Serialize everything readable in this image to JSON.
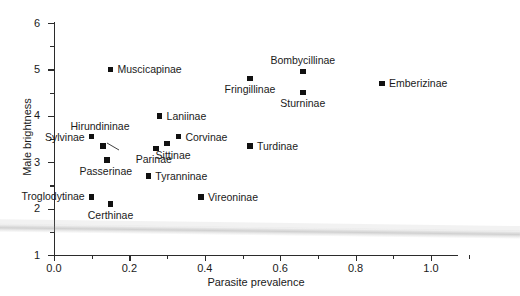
{
  "chart_data": {
    "type": "scatter",
    "title": "",
    "xlabel": "Parasite prevalence",
    "ylabel": "Male brightness",
    "xlim": [
      0.0,
      1.1
    ],
    "ylim": [
      1,
      6
    ],
    "grid": false,
    "legend": "none",
    "marker": "filled-square",
    "marker_color": "#111111",
    "xticks_major": [
      0.0,
      0.2,
      0.4,
      0.6,
      0.8,
      1.0
    ],
    "xticks_major_labels": [
      "0.0",
      "0.2",
      "0.4",
      "0.6",
      "0.8",
      "1.0"
    ],
    "xticks_minor": [
      0.1,
      0.3,
      0.5,
      0.7,
      0.9,
      1.1
    ],
    "yticks_major": [
      1,
      2,
      3,
      4,
      5,
      6
    ],
    "yticks_major_labels": [
      "1",
      "2",
      "3",
      "4",
      "5",
      "6"
    ],
    "yticks_minor": [
      1.5,
      2.5,
      3.5,
      4.5,
      5.5
    ],
    "points": [
      {
        "label": "Muscicapinae",
        "x": 0.15,
        "y": 5.0,
        "label_pos": "right"
      },
      {
        "label": "Bombycillinae",
        "x": 0.66,
        "y": 4.95,
        "label_pos": "above"
      },
      {
        "label": "Fringillinae",
        "x": 0.52,
        "y": 4.8,
        "label_pos": "below"
      },
      {
        "label": "Emberizinae",
        "x": 0.87,
        "y": 4.7,
        "label_pos": "right"
      },
      {
        "label": "Sturninae",
        "x": 0.66,
        "y": 4.5,
        "label_pos": "below"
      },
      {
        "label": "Laniinae",
        "x": 0.28,
        "y": 4.0,
        "label_pos": "right"
      },
      {
        "label": "Sylvinae",
        "x": 0.1,
        "y": 3.55,
        "label_pos": "left"
      },
      {
        "label": "Corvinae",
        "x": 0.33,
        "y": 3.55,
        "label_pos": "right"
      },
      {
        "label": "Hirundininae",
        "x": 0.13,
        "y": 3.35,
        "label_pos": "leader"
      },
      {
        "label": "Sittinae",
        "x": 0.3,
        "y": 3.4,
        "label_pos": "below-right"
      },
      {
        "label": "Turdinae",
        "x": 0.52,
        "y": 3.35,
        "label_pos": "right"
      },
      {
        "label": "Parinae",
        "x": 0.27,
        "y": 3.3,
        "label_pos": "below"
      },
      {
        "label": "Passerinae",
        "x": 0.14,
        "y": 3.05,
        "label_pos": "below"
      },
      {
        "label": "Tyranninae",
        "x": 0.25,
        "y": 2.7,
        "label_pos": "right"
      },
      {
        "label": "Troglodytinae",
        "x": 0.1,
        "y": 2.25,
        "label_pos": "left-below"
      },
      {
        "label": "Vireoninae",
        "x": 0.39,
        "y": 2.25,
        "label_pos": "right"
      },
      {
        "label": "Certhinae",
        "x": 0.15,
        "y": 2.1,
        "label_pos": "below"
      }
    ]
  },
  "axes": {
    "x_title": "Parasite prevalence",
    "y_title": "Male brightness"
  }
}
